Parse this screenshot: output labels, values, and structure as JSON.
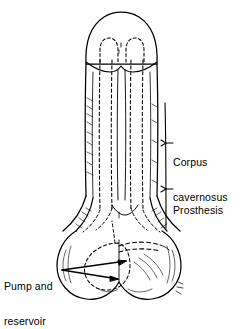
{
  "figure": {
    "type": "medical-line-illustration",
    "style": "black-and-white pen-and-ink line drawing on white background",
    "background_color": "#ffffff",
    "line_color": "#000000",
    "implant_rendering": "dashed outline (hidden internal device)",
    "anatomy_rendering": "solid outline with stipple and hatch shading"
  },
  "labels": {
    "corpus_cavernosus": {
      "line1": "Corpus",
      "line2": "cavernosus",
      "leader": "vertical line with tick pointing left to shaft"
    },
    "prosthesis": {
      "line1": "Prosthesis",
      "leader": "vertical line with tick pointing left to shaft"
    },
    "pump_and_reservoir": {
      "line1": "Pump and",
      "line2": "reservoir",
      "leader": "double arrow pointing right into scrotum"
    }
  },
  "caption": {
    "text": "",
    "note": "caption clipped by bottom edge of image; only tops of glyphs visible"
  },
  "parts": [
    {
      "name": "glans-penis",
      "description": "rounded dome cap at top"
    },
    {
      "name": "penile-shaft",
      "description": "vertical shaft with paired corpora cavernosa"
    },
    {
      "name": "prosthesis-cylinder-left",
      "description": "dashed cylinder inside left corpus"
    },
    {
      "name": "prosthesis-cylinder-right",
      "description": "dashed cylinder inside right corpus"
    },
    {
      "name": "prosthesis-tip-left",
      "description": "dashed rounded tip beneath glans"
    },
    {
      "name": "prosthesis-tip-right",
      "description": "dashed rounded tip beneath glans"
    },
    {
      "name": "crus-left",
      "description": "left base wing curving down and out"
    },
    {
      "name": "crus-right",
      "description": "right base wing curving down and out"
    },
    {
      "name": "scrotum",
      "description": "bilobed sac at base"
    },
    {
      "name": "pump-bulb",
      "description": "dashed circular pump in left scrotal lobe"
    },
    {
      "name": "reservoir-tubing",
      "description": "dashed tube running across scrotum"
    }
  ]
}
